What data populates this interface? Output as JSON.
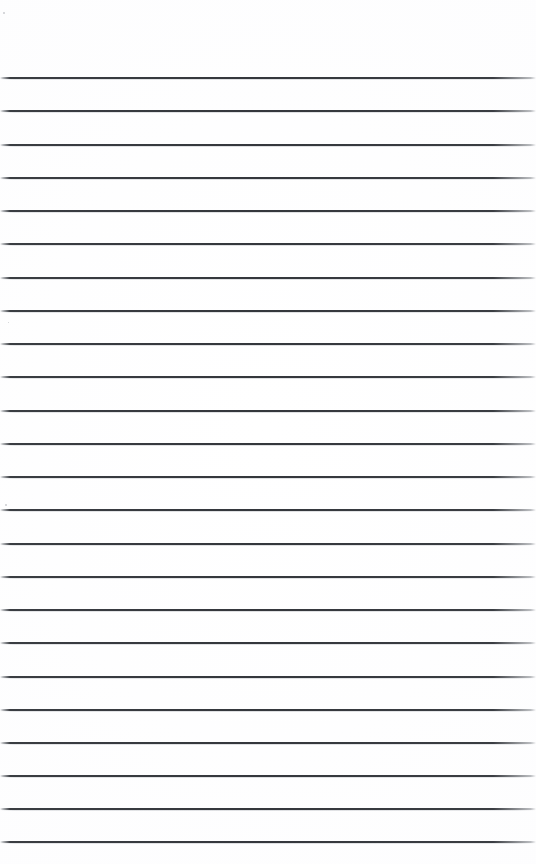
{
  "page": {
    "kind": "blank-lined-notepad-page",
    "width_px": 536,
    "height_px": 864,
    "background_color": "#ffffff",
    "paper_tint_color": "#fefefe",
    "has_visible_text": false,
    "content_text": ""
  },
  "ruling": {
    "line_color": "#34373c",
    "line_color_soft": "#787c82",
    "line_thickness_px": 2,
    "line_count": 24,
    "first_line_y_px": 77,
    "line_spacing_px": 33.2,
    "line_left_x_px": 0,
    "line_right_x_px": 536,
    "ends_fade": true,
    "line_y_positions": [
      77,
      110,
      144,
      177,
      210,
      243,
      277,
      310,
      343,
      376,
      410,
      443,
      476,
      509,
      543,
      576,
      609,
      642,
      676,
      709,
      742,
      775,
      808,
      841
    ]
  },
  "margins": {
    "top_margin_height_px": 77,
    "bottom_margin_height_px": 23,
    "top_margin_label": "top margin",
    "bottom_margin_label": "bottom margin"
  },
  "artifacts": {
    "specks": [
      {
        "x_px": 5,
        "y_px": 504,
        "size_px": 2
      },
      {
        "x_px": 8,
        "y_px": 322,
        "size_px": 1
      },
      {
        "x_px": 3,
        "y_px": 12,
        "size_px": 2
      }
    ]
  }
}
